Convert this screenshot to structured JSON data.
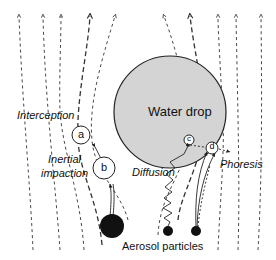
{
  "diagram": {
    "drop_label": "Water drop",
    "mechanisms": {
      "interception": "Interception",
      "inertial_line1": "Inertial",
      "inertial_line2": "impaction",
      "diffusion": "Diffusion",
      "phoresis": "Phoresis"
    },
    "particle_markers": [
      "a",
      "b",
      "c",
      "d"
    ],
    "bottom_label": "Aerosol particles",
    "colors": {
      "stroke": "#222222",
      "drop_fill": "#d4d4d4",
      "particle_fill": "#111111"
    }
  }
}
